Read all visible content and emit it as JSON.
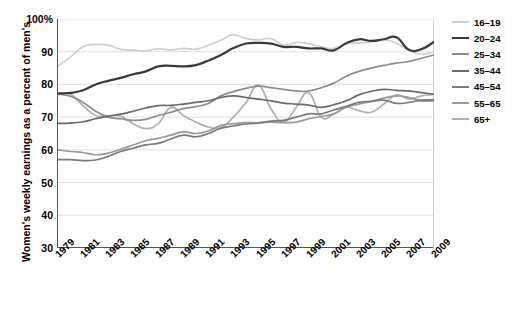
{
  "chart_data": {
    "type": "line",
    "title": "",
    "xlabel": "",
    "ylabel": "Women's weekly earnings as a percent of men's",
    "ylim": [
      30,
      100
    ],
    "yticks": [
      "30",
      "40",
      "50",
      "60",
      "70",
      "80",
      "90",
      "100%"
    ],
    "xlim": [
      1979,
      2009
    ],
    "grid": true,
    "legend_position": "right",
    "x": [
      1979,
      1980,
      1981,
      1982,
      1983,
      1984,
      1985,
      1986,
      1987,
      1988,
      1989,
      1990,
      1991,
      1992,
      1993,
      1994,
      1995,
      1996,
      1997,
      1998,
      1999,
      2000,
      2001,
      2002,
      2003,
      2004,
      2005,
      2006,
      2007,
      2008,
      2009
    ],
    "xtick_labels": [
      "1979",
      "1981",
      "1983",
      "1985",
      "1987",
      "1989",
      "1991",
      "1993",
      "1995",
      "1997",
      "1999",
      "2001",
      "2003",
      "2005",
      "2007",
      "2009"
    ],
    "series": [
      {
        "name": "16-19",
        "color": "#cfcfcf",
        "values": [
          85.6,
          88.4,
          91.5,
          92.2,
          92.0,
          90.7,
          90.5,
          90.3,
          90.9,
          90.5,
          91.0,
          90.8,
          92.0,
          93.5,
          95.2,
          94.0,
          93.6,
          94.0,
          92.0,
          92.8,
          92.5,
          91.5,
          91.0,
          92.5,
          92.7,
          93.0,
          93.7,
          92.6,
          90.5,
          89.2,
          90.0
        ]
      },
      {
        "name": "20-24",
        "color": "#3a3a3a",
        "values": [
          77.3,
          77.4,
          78.2,
          80.0,
          81.1,
          82.0,
          83.1,
          84.0,
          85.5,
          85.7,
          85.5,
          85.9,
          87.3,
          89.0,
          91.1,
          92.5,
          92.7,
          92.5,
          91.5,
          91.5,
          91.0,
          91.0,
          90.4,
          92.6,
          93.8,
          93.3,
          93.8,
          94.4,
          90.6,
          90.8,
          93.0
        ]
      },
      {
        "name": "25-34",
        "color": "#8d8d8d",
        "values": [
          77.0,
          76.4,
          74.5,
          71.8,
          70.0,
          69.5,
          69.0,
          69.3,
          70.5,
          71.5,
          72.6,
          73.2,
          74.2,
          76.5,
          77.8,
          78.8,
          79.5,
          79.0,
          78.5,
          78.0,
          78.0,
          79.0,
          80.4,
          82.5,
          84.0,
          85.0,
          85.8,
          86.5,
          87.0,
          88.0,
          89.0
        ]
      },
      {
        "name": "35-44",
        "color": "#6a6a6a",
        "values": [
          68.1,
          68.2,
          68.6,
          69.5,
          70.3,
          70.9,
          71.8,
          72.8,
          73.5,
          73.6,
          74.0,
          74.5,
          75.0,
          76.0,
          76.5,
          76.0,
          75.5,
          75.0,
          74.3,
          74.0,
          73.7,
          73.0,
          73.8,
          75.0,
          76.8,
          77.9,
          78.5,
          78.2,
          78.0,
          77.5,
          77.0
        ]
      },
      {
        "name": "45-54",
        "color": "#7a7a7a",
        "values": [
          57.0,
          57.0,
          56.7,
          56.9,
          58.0,
          59.5,
          60.5,
          61.5,
          62.0,
          63.3,
          64.5,
          64.0,
          65.0,
          66.6,
          67.3,
          67.9,
          68.2,
          68.8,
          69.0,
          70.0,
          71.0,
          71.0,
          72.2,
          73.3,
          74.5,
          74.8,
          75.2,
          74.2,
          74.5,
          75.2,
          75.3
        ]
      },
      {
        "name": "55-65",
        "color": "#9a9a9a",
        "values": [
          60.0,
          59.5,
          59.2,
          58.5,
          59.0,
          60.2,
          61.5,
          62.8,
          63.5,
          64.5,
          65.5,
          65.0,
          65.8,
          67.5,
          68.0,
          68.3,
          68.3,
          68.5,
          68.3,
          68.5,
          69.5,
          70.2,
          71.0,
          73.0,
          74.0,
          74.8,
          75.8,
          76.5,
          76.0,
          75.0,
          75.0
        ]
      },
      {
        "name": "65+",
        "color": "#b0b0b0",
        "values": [
          76.9,
          77.0,
          73.5,
          70.5,
          70.4,
          70.3,
          68.0,
          66.5,
          68.0,
          73.0,
          70.5,
          68.5,
          67.0,
          66.8,
          70.0,
          74.5,
          79.8,
          72.5,
          68.5,
          73.0,
          77.5,
          70.0,
          71.0,
          73.0,
          72.0,
          71.5,
          74.0,
          76.8,
          75.5,
          76.5,
          77.0
        ]
      }
    ]
  },
  "legend": {
    "items": [
      {
        "label": "16–19",
        "color": "#cfcfcf"
      },
      {
        "label": "20–24",
        "color": "#3a3a3a"
      },
      {
        "label": "25–34",
        "color": "#8d8d8d"
      },
      {
        "label": "35–44",
        "color": "#6a6a6a"
      },
      {
        "label": "45–54",
        "color": "#7a7a7a"
      },
      {
        "label": "55–65",
        "color": "#9a9a9a"
      },
      {
        "label": "65+",
        "color": "#b0b0b0"
      }
    ]
  }
}
